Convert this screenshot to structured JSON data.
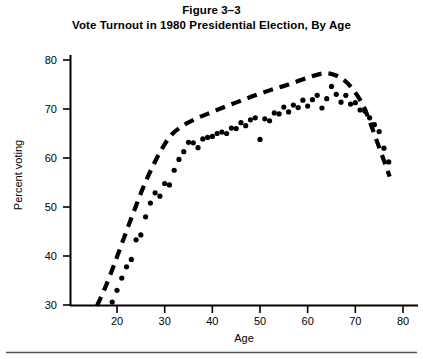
{
  "figure": {
    "number_label": "Figure 3–3",
    "caption": "Vote Turnout in 1980 Presidential Election, By Age"
  },
  "axes": {
    "x_title": "Age",
    "y_title": "Percent voting",
    "x_ticks": [
      "20",
      "30",
      "40",
      "50",
      "60",
      "70",
      "80"
    ],
    "y_ticks": [
      "80",
      "70",
      "60",
      "50",
      "40",
      "30"
    ]
  },
  "colors": {
    "ink": "#000000",
    "rule": "#555555",
    "background": "#ffffff"
  },
  "chart_data": {
    "type": "scatter",
    "title": "Vote Turnout in 1980 Presidential Election, By Age",
    "xlabel": "Age",
    "ylabel": "Percent voting",
    "xlim": [
      14,
      82
    ],
    "ylim": [
      30,
      82
    ],
    "xticks": [
      20,
      30,
      40,
      50,
      60,
      70,
      80
    ],
    "yticks": [
      30,
      40,
      50,
      60,
      70,
      80
    ],
    "grid": false,
    "legend": "none",
    "series": [
      {
        "name": "Percent voting by single year of age",
        "type": "scatter",
        "marker": "filled-circle",
        "points": [
          [
            19,
            30.6
          ],
          [
            20,
            33.0
          ],
          [
            21,
            35.5
          ],
          [
            22,
            37.8
          ],
          [
            23,
            39.3
          ],
          [
            24,
            43.3
          ],
          [
            25,
            44.3
          ],
          [
            26,
            48.0
          ],
          [
            27,
            50.8
          ],
          [
            28,
            52.9
          ],
          [
            29,
            52.2
          ],
          [
            30,
            54.8
          ],
          [
            31,
            54.5
          ],
          [
            32,
            57.5
          ],
          [
            33,
            59.7
          ],
          [
            34,
            61.3
          ],
          [
            35,
            63.2
          ],
          [
            36,
            63.1
          ],
          [
            37,
            62.1
          ],
          [
            38,
            63.9
          ],
          [
            39,
            64.2
          ],
          [
            40,
            64.4
          ],
          [
            41,
            65.0
          ],
          [
            42,
            65.3
          ],
          [
            43,
            65.0
          ],
          [
            44,
            66.1
          ],
          [
            45,
            66.0
          ],
          [
            46,
            67.2
          ],
          [
            47,
            66.6
          ],
          [
            48,
            67.8
          ],
          [
            49,
            68.2
          ],
          [
            50,
            63.8
          ],
          [
            51,
            68.0
          ],
          [
            52,
            67.6
          ],
          [
            53,
            69.2
          ],
          [
            54,
            69.0
          ],
          [
            55,
            70.4
          ],
          [
            56,
            69.4
          ],
          [
            57,
            70.8
          ],
          [
            58,
            70.3
          ],
          [
            59,
            71.8
          ],
          [
            60,
            70.6
          ],
          [
            61,
            71.9
          ],
          [
            62,
            72.8
          ],
          [
            63,
            70.2
          ],
          [
            64,
            72.1
          ],
          [
            65,
            74.6
          ],
          [
            66,
            73.0
          ],
          [
            67,
            71.4
          ],
          [
            68,
            72.8
          ],
          [
            69,
            71.0
          ],
          [
            70,
            71.3
          ],
          [
            71,
            69.8
          ],
          [
            72,
            69.6
          ],
          [
            73,
            68.2
          ],
          [
            74,
            66.8
          ],
          [
            75,
            65.4
          ],
          [
            76,
            62.0
          ],
          [
            77,
            59.2
          ]
        ]
      },
      {
        "name": "Smoothed trend (dashed)",
        "type": "line",
        "linestyle": "dashed",
        "points": [
          [
            15.8,
            29.8
          ],
          [
            17.5,
            33.5
          ],
          [
            19.5,
            38.5
          ],
          [
            21.5,
            43.8
          ],
          [
            23.5,
            49.0
          ],
          [
            25.5,
            54.0
          ],
          [
            27.5,
            58.3
          ],
          [
            29.5,
            62.0
          ],
          [
            31.5,
            64.8
          ],
          [
            34.0,
            66.7
          ],
          [
            37.0,
            68.2
          ],
          [
            40.0,
            69.4
          ],
          [
            43.0,
            70.6
          ],
          [
            46.0,
            71.7
          ],
          [
            49.0,
            72.8
          ],
          [
            52.0,
            73.8
          ],
          [
            55.0,
            74.7
          ],
          [
            58.0,
            75.7
          ],
          [
            61.0,
            76.7
          ],
          [
            63.5,
            77.3
          ],
          [
            65.5,
            77.0
          ],
          [
            67.5,
            76.0
          ],
          [
            69.5,
            74.0
          ],
          [
            71.5,
            71.0
          ],
          [
            73.0,
            67.5
          ],
          [
            74.5,
            63.5
          ],
          [
            76.0,
            59.5
          ],
          [
            77.2,
            56.2
          ]
        ]
      }
    ]
  }
}
